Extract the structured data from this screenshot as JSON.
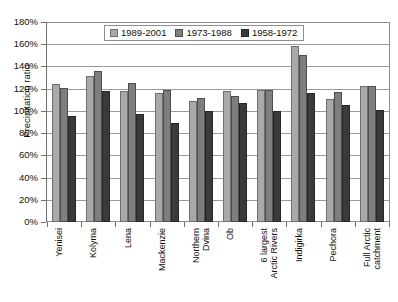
{
  "chart_data": {
    "type": "bar",
    "title": "",
    "subtitle": "",
    "xlabel": "",
    "ylabel": "Precipitation ratio",
    "ylim": [
      0,
      180
    ],
    "y_unit": "%",
    "grid": true,
    "legend_position": "top-center",
    "y_ticks": [
      "0%",
      "20%",
      "40%",
      "60%",
      "80%",
      "100%",
      "120%",
      "140%",
      "160%",
      "180%"
    ],
    "y_tick_values": [
      0,
      20,
      40,
      60,
      80,
      100,
      120,
      140,
      160,
      180
    ],
    "categories": [
      "Yenisei",
      "Kolyma",
      "Lena",
      "Mackenzie",
      "Northern\nDvina",
      "Ob",
      "6 largest\nArctic Rivers",
      "Indigirka",
      "Pechora",
      "Full Arctic\ncatchment"
    ],
    "series": [
      {
        "name": "1989-2001",
        "color": "#a9a9a9",
        "values": [
          124,
          131,
          118,
          116,
          109,
          118,
          119,
          158,
          111,
          122
        ]
      },
      {
        "name": "1973-1988",
        "color": "#7e7e7e",
        "values": [
          121,
          136,
          125,
          119,
          112,
          113,
          119,
          150,
          117,
          122
        ]
      },
      {
        "name": "1958-1972",
        "color": "#3a3a3a",
        "values": [
          95,
          118,
          97,
          89,
          100,
          107,
          100,
          116,
          105,
          101
        ]
      }
    ]
  }
}
